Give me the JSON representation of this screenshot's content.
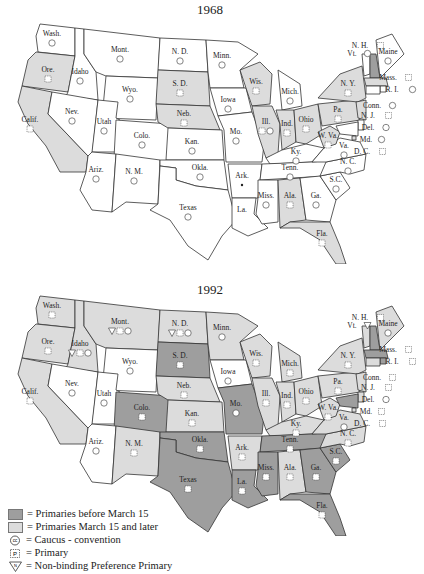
{
  "colors": {
    "before_march15": "#9e9e9e",
    "march15_later": "#dcdcdc",
    "caucus": "#ffffff"
  },
  "map1968": {
    "title": "1968",
    "states": [
      {
        "abbr": "Wash.",
        "fill": "caucus",
        "symbol": "D caucus / R caucus"
      },
      {
        "abbr": "Ore.",
        "fill": "march15_later",
        "symbol": "primary"
      },
      {
        "abbr": "Calif.",
        "fill": "march15_later",
        "symbol": "primary"
      },
      {
        "abbr": "Idaho",
        "fill": "caucus",
        "symbol": "caucus"
      },
      {
        "abbr": "Nev.",
        "fill": "caucus",
        "symbol": "caucus"
      },
      {
        "abbr": "Mont.",
        "fill": "caucus",
        "symbol": "caucus"
      },
      {
        "abbr": "Wyo.",
        "fill": "caucus",
        "symbol": "caucus"
      },
      {
        "abbr": "Utah",
        "fill": "caucus",
        "symbol": "caucus"
      },
      {
        "abbr": "Colo.",
        "fill": "caucus",
        "symbol": "caucus"
      },
      {
        "abbr": "Ariz.",
        "fill": "caucus",
        "symbol": "D • / R caucus"
      },
      {
        "abbr": "N. M.",
        "fill": "caucus",
        "symbol": "caucus"
      },
      {
        "abbr": "N. D.",
        "fill": "caucus",
        "symbol": "caucus"
      },
      {
        "abbr": "S. D.",
        "fill": "march15_later",
        "symbol": "primary"
      },
      {
        "abbr": "Neb.",
        "fill": "march15_later",
        "symbol": "primary"
      },
      {
        "abbr": "Kan.",
        "fill": "caucus",
        "symbol": "caucus"
      },
      {
        "abbr": "Okla.",
        "fill": "caucus",
        "symbol": "caucus"
      },
      {
        "abbr": "Texas",
        "fill": "caucus",
        "symbol": "caucus"
      },
      {
        "abbr": "Minn.",
        "fill": "caucus",
        "symbol": "caucus"
      },
      {
        "abbr": "Iowa",
        "fill": "caucus",
        "symbol": "caucus"
      },
      {
        "abbr": "Mo.",
        "fill": "caucus",
        "symbol": "D caucus • / R caucus"
      },
      {
        "abbr": "Ark.",
        "fill": "caucus",
        "symbol": "•"
      },
      {
        "abbr": "La.",
        "fill": "caucus",
        "symbol": ""
      },
      {
        "abbr": "Wis.",
        "fill": "march15_later",
        "symbol": "primary"
      },
      {
        "abbr": "Ill.",
        "fill": "march15_later",
        "symbol": "primary caucus"
      },
      {
        "abbr": "Mich.",
        "fill": "caucus",
        "symbol": "caucus"
      },
      {
        "abbr": "Ind.",
        "fill": "march15_later",
        "symbol": "primary"
      },
      {
        "abbr": "Ohio",
        "fill": "march15_later",
        "symbol": "primary"
      },
      {
        "abbr": "Ky.",
        "fill": "caucus",
        "symbol": "caucus"
      },
      {
        "abbr": "Tenn.",
        "fill": "caucus",
        "symbol": "caucus"
      },
      {
        "abbr": "Miss.",
        "fill": "caucus",
        "symbol": "caucus"
      },
      {
        "abbr": "Ala.",
        "fill": "march15_later",
        "symbol": "primary"
      },
      {
        "abbr": "Ga.",
        "fill": "caucus",
        "symbol": "D • / R caucus"
      },
      {
        "abbr": "Fla.",
        "fill": "march15_later",
        "symbol": "primary"
      },
      {
        "abbr": "S.C.",
        "fill": "caucus",
        "symbol": "caucus"
      },
      {
        "abbr": "N. C.",
        "fill": "caucus",
        "symbol": "caucus"
      },
      {
        "abbr": "Va.",
        "fill": "caucus",
        "symbol": "caucus"
      },
      {
        "abbr": "W. Va.",
        "fill": "march15_later",
        "symbol": "primary"
      },
      {
        "abbr": "Pa.",
        "fill": "march15_later",
        "symbol": "primary •"
      },
      {
        "abbr": "N. Y.",
        "fill": "march15_later",
        "symbol": "primary •"
      },
      {
        "abbr": "Vt.",
        "fill": "caucus",
        "symbol": "caucus"
      },
      {
        "abbr": "N. H.",
        "fill": "before_march15",
        "symbol": "primary"
      },
      {
        "abbr": "Maine",
        "fill": "caucus",
        "symbol": "caucus"
      },
      {
        "abbr": "Mass.",
        "fill": "march15_later",
        "symbol": "primary"
      },
      {
        "abbr": "R. I.",
        "fill": "caucus",
        "symbol": "D • R caucus"
      },
      {
        "abbr": "Conn.",
        "fill": "caucus",
        "symbol": "caucus"
      },
      {
        "abbr": "N. J.",
        "fill": "march15_later",
        "symbol": "primary"
      },
      {
        "abbr": "Del.",
        "fill": "caucus",
        "symbol": "caucus"
      },
      {
        "abbr": "Md.",
        "fill": "caucus",
        "symbol": "D • R caucus"
      },
      {
        "abbr": "D. C.",
        "fill": "march15_later",
        "symbol": "primary"
      }
    ]
  },
  "map1992": {
    "title": "1992",
    "states": [
      {
        "abbr": "Wash.",
        "fill": "march15_later",
        "symbol": "primary"
      },
      {
        "abbr": "Ore.",
        "fill": "march15_later",
        "symbol": "primary"
      },
      {
        "abbr": "Calif.",
        "fill": "march15_later",
        "symbol": "primary"
      },
      {
        "abbr": "Idaho",
        "fill": "march15_later",
        "symbol": "D non-binding caucus / R primary"
      },
      {
        "abbr": "Nev.",
        "fill": "caucus",
        "symbol": "caucus"
      },
      {
        "abbr": "Mont.",
        "fill": "march15_later",
        "symbol": "D primary / R non-binding caucus"
      },
      {
        "abbr": "Wyo.",
        "fill": "caucus",
        "symbol": "caucus"
      },
      {
        "abbr": "Utah",
        "fill": "caucus",
        "symbol": "caucus"
      },
      {
        "abbr": "Colo.",
        "fill": "before_march15",
        "symbol": "primary"
      },
      {
        "abbr": "Ariz.",
        "fill": "caucus",
        "symbol": "caucus"
      },
      {
        "abbr": "N. M.",
        "fill": "march15_later",
        "symbol": "primary"
      },
      {
        "abbr": "N. D.",
        "fill": "march15_later",
        "symbol": "D non-binding caucus / R primary"
      },
      {
        "abbr": "S. D.",
        "fill": "before_march15",
        "symbol": "primary"
      },
      {
        "abbr": "Neb.",
        "fill": "march15_later",
        "symbol": "primary"
      },
      {
        "abbr": "Kan.",
        "fill": "march15_later",
        "symbol": "primary"
      },
      {
        "abbr": "Okla.",
        "fill": "before_march15",
        "symbol": "primary"
      },
      {
        "abbr": "Texas",
        "fill": "before_march15",
        "symbol": "primary"
      },
      {
        "abbr": "Minn.",
        "fill": "march15_later",
        "symbol": "caucus"
      },
      {
        "abbr": "Iowa",
        "fill": "caucus",
        "symbol": "caucus"
      },
      {
        "abbr": "Mo.",
        "fill": "before_march15",
        "symbol": "caucus"
      },
      {
        "abbr": "Ark.",
        "fill": "march15_later",
        "symbol": "primary"
      },
      {
        "abbr": "La.",
        "fill": "before_march15",
        "symbol": "primary"
      },
      {
        "abbr": "Wis.",
        "fill": "march15_later",
        "symbol": "primary"
      },
      {
        "abbr": "Ill.",
        "fill": "march15_later",
        "symbol": "primary"
      },
      {
        "abbr": "Mich.",
        "fill": "march15_later",
        "symbol": "primary"
      },
      {
        "abbr": "Ind.",
        "fill": "march15_later",
        "symbol": "primary"
      },
      {
        "abbr": "Ohio",
        "fill": "march15_later",
        "symbol": "primary"
      },
      {
        "abbr": "Ky.",
        "fill": "march15_later",
        "symbol": "primary"
      },
      {
        "abbr": "Tenn.",
        "fill": "before_march15",
        "symbol": "primary"
      },
      {
        "abbr": "Miss.",
        "fill": "before_march15",
        "symbol": "primary"
      },
      {
        "abbr": "Ala.",
        "fill": "march15_later",
        "symbol": "primary"
      },
      {
        "abbr": "Ga.",
        "fill": "before_march15",
        "symbol": "primary"
      },
      {
        "abbr": "Fla.",
        "fill": "before_march15",
        "symbol": "primary"
      },
      {
        "abbr": "S.C.",
        "fill": "before_march15",
        "symbol": "primary"
      },
      {
        "abbr": "N. C.",
        "fill": "march15_later",
        "symbol": "primary"
      },
      {
        "abbr": "Va.",
        "fill": "march15_later",
        "symbol": "caucus"
      },
      {
        "abbr": "W. Va.",
        "fill": "march15_later",
        "symbol": "primary"
      },
      {
        "abbr": "Pa.",
        "fill": "march15_later",
        "symbol": "primary"
      },
      {
        "abbr": "N. Y.",
        "fill": "march15_later",
        "symbol": "primary"
      },
      {
        "abbr": "Vt.",
        "fill": "march15_later",
        "symbol": "non-binding caucus"
      },
      {
        "abbr": "N. H.",
        "fill": "before_march15",
        "symbol": "primary"
      },
      {
        "abbr": "Maine",
        "fill": "march15_later",
        "symbol": "caucus"
      },
      {
        "abbr": "Mass.",
        "fill": "before_march15",
        "symbol": "primary"
      },
      {
        "abbr": "R. I.",
        "fill": "before_march15",
        "symbol": "primary"
      },
      {
        "abbr": "Conn.",
        "fill": "march15_later",
        "symbol": "primary"
      },
      {
        "abbr": "N. J.",
        "fill": "march15_later",
        "symbol": "primary"
      },
      {
        "abbr": "Del.",
        "fill": "march15_later",
        "symbol": "caucus"
      },
      {
        "abbr": "Md.",
        "fill": "before_march15",
        "symbol": "primary"
      },
      {
        "abbr": "D. C.",
        "fill": "march15_later",
        "symbol": "primary"
      }
    ]
  },
  "legend": {
    "items": [
      {
        "icon": "swatch-dark",
        "label": "= Primaries before March 15"
      },
      {
        "icon": "swatch-light",
        "label": "= Primaries March 15 and later"
      },
      {
        "icon": "caucus-circle",
        "label": "= Caucus - convention"
      },
      {
        "icon": "primary-box",
        "label": "= Primary"
      },
      {
        "icon": "triangle",
        "label": "= Non-binding Preference Primary"
      }
    ]
  }
}
